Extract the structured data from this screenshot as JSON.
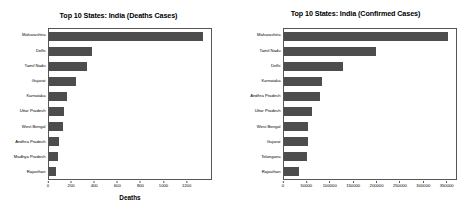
{
  "figure": {
    "background": "#ffffff",
    "bar_color": "#4d4d4d",
    "axis_color": "#555555"
  },
  "chart_data": [
    {
      "type": "bar",
      "orientation": "horizontal",
      "title": "Top 10 States: India (Deaths Cases)",
      "xlabel": "Deaths",
      "ylabel": "",
      "grid": false,
      "legend": "none",
      "xlim": [
        0,
        1420
      ],
      "xticks": [
        0,
        200,
        400,
        600,
        800,
        1000,
        1200
      ],
      "xticklabels": [
        "0",
        "200",
        "400",
        "600",
        "800",
        "1000",
        "1200"
      ],
      "categories": [
        "Maharashtra",
        "Delhi",
        "Tamil Nadu",
        "Gujarat",
        "Karnataka",
        "Uttar Pradesh",
        "West Bengal",
        "Andhra Pradesh",
        "Madhya Pradesh",
        "Rajasthan"
      ],
      "values": [
        1350,
        375,
        335,
        235,
        160,
        130,
        120,
        85,
        80,
        60
      ]
    },
    {
      "type": "bar",
      "orientation": "horizontal",
      "title": "Top 10 States: India (Confirmed Cases)",
      "xlabel": "",
      "ylabel": "",
      "grid": false,
      "legend": "none",
      "xlim": [
        0,
        372000
      ],
      "xticks": [
        0,
        50000,
        100000,
        150000,
        200000,
        250000,
        300000,
        350000
      ],
      "xticklabels": [
        "0",
        "50000",
        "100000",
        "150000",
        "200000",
        "250000",
        "300000",
        "350000"
      ],
      "categories": [
        "Maharashtra",
        "Tamil Nadu",
        "Delhi",
        "Karnataka",
        "Andhra Pradesh",
        "Uttar Pradesh",
        "West Bengal",
        "Gujarat",
        "Telangana",
        "Rajasthan"
      ],
      "values": [
        355000,
        199000,
        128000,
        83000,
        78000,
        60000,
        52000,
        52000,
        50000,
        32000
      ]
    }
  ]
}
